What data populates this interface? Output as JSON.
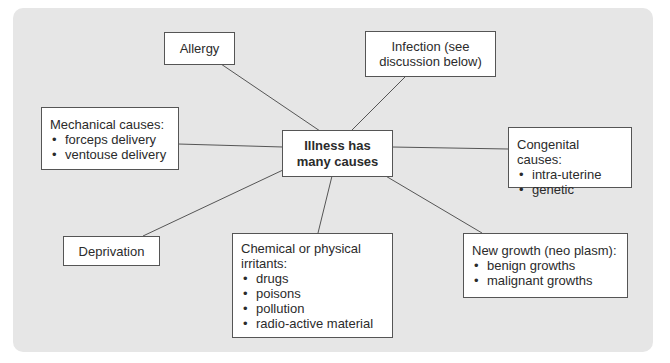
{
  "diagram": {
    "type": "mind-map",
    "background_color": "#e6e6e6",
    "box_color": "#ffffff",
    "line_color": "#555555",
    "center": {
      "line1": "Illness has",
      "line2": "many causes"
    },
    "nodes": {
      "allergy": {
        "label": "Allergy"
      },
      "infection": {
        "line1": "Infection (see",
        "line2": "discussion below)"
      },
      "mechanical": {
        "title": "Mechanical causes:",
        "items": [
          "forceps delivery",
          "ventouse delivery"
        ]
      },
      "congenital": {
        "title": "Congenital causes:",
        "items": [
          "intra-uterine",
          "genetic"
        ]
      },
      "deprivation": {
        "label": "Deprivation"
      },
      "chemical": {
        "title": "Chemical or physical irritants:",
        "items": [
          "drugs",
          "poisons",
          "pollution",
          "radio-active material"
        ]
      },
      "new_growth": {
        "title": "New growth (neo plasm):",
        "items": [
          "benign growths",
          "malignant growths"
        ]
      }
    },
    "edges": [
      {
        "from": "center",
        "to": "allergy"
      },
      {
        "from": "center",
        "to": "infection"
      },
      {
        "from": "center",
        "to": "mechanical"
      },
      {
        "from": "center",
        "to": "congenital"
      },
      {
        "from": "center",
        "to": "deprivation"
      },
      {
        "from": "center",
        "to": "chemical"
      },
      {
        "from": "center",
        "to": "new_growth"
      }
    ]
  }
}
